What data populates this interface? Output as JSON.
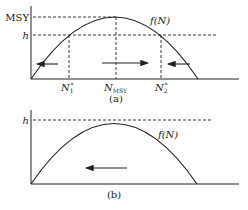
{
  "panel_a": {
    "caption": "(a)",
    "y_labels": {
      "msy": "MSY",
      "h": "h"
    },
    "curve_label": "f(N)",
    "x_labels": {
      "n1": "N",
      "n1_sub": "1",
      "n1_sup": "*",
      "nmsy": "N",
      "nmsy_sub": "MSY",
      "n2": "N",
      "n2_sub": "2",
      "n2_sup": "*"
    },
    "arrows": [
      "left",
      "right",
      "left"
    ]
  },
  "panel_b": {
    "caption": "(b)",
    "y_labels": {
      "h": "h"
    },
    "curve_label": "f(N)",
    "arrows": [
      "left"
    ]
  },
  "colors": {
    "line": "#222222",
    "background": "#ffffff"
  }
}
